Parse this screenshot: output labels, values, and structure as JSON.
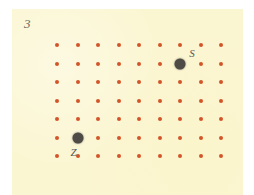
{
  "figure": {
    "number_label": "3",
    "background_color": "#fbf6d2",
    "page_color": "#ffffff"
  },
  "grid": {
    "columns": 9,
    "rows": 7,
    "dot_color": "#d2552a",
    "origin_x": 57,
    "origin_y": 45,
    "spacing_x": 20.5,
    "spacing_y": 18.5,
    "dot_radius": 2
  },
  "markers": [
    {
      "label": "S",
      "column": 7,
      "row": 2,
      "color": "#4e4a46",
      "label_dx": 12,
      "label_dy": -11
    },
    {
      "label": "Z",
      "column": 2,
      "row": 6,
      "color": "#4e4a46",
      "label_dx": -4,
      "label_dy": 14
    }
  ]
}
